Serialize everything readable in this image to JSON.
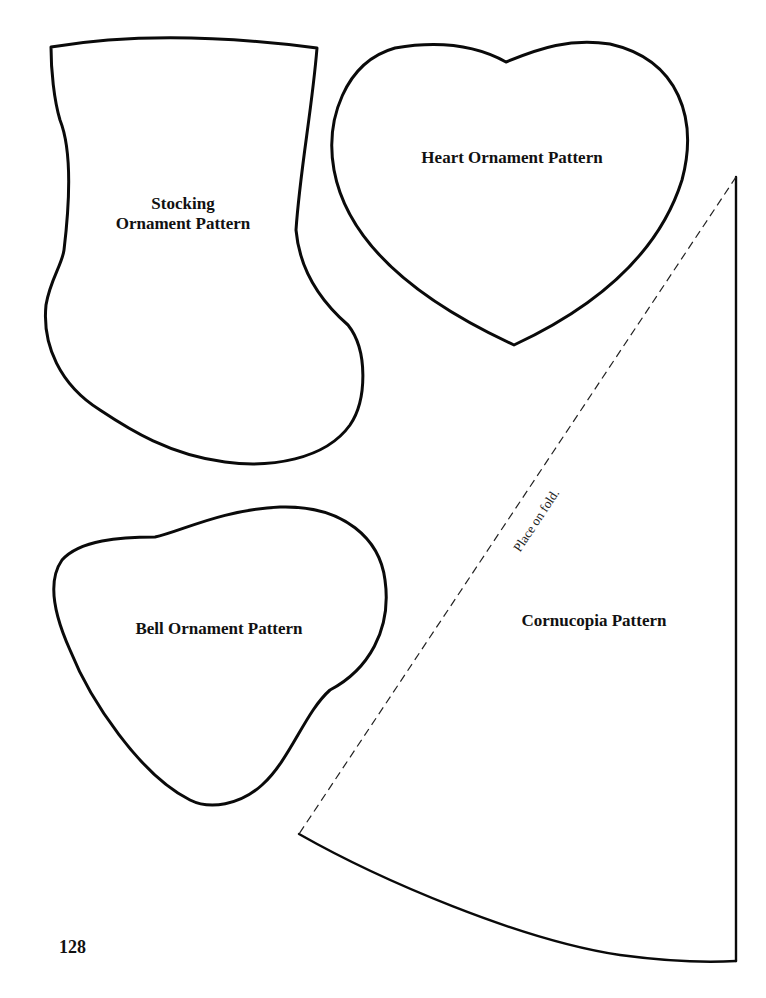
{
  "patterns": {
    "stocking": {
      "line1": "Stocking",
      "line2": "Ornament Pattern"
    },
    "heart": {
      "label": "Heart Ornament Pattern"
    },
    "bell": {
      "label": "Bell Ornament Pattern"
    },
    "cornucopia": {
      "label": "Cornucopia Pattern",
      "fold_instruction": "Place on fold."
    }
  },
  "page_number": "128",
  "colors": {
    "line": "#0a0a0a",
    "background": "#ffffff"
  }
}
